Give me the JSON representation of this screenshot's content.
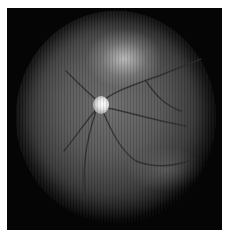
{
  "image": {
    "subject": "retinal fundus photograph",
    "style": "grayscale",
    "features": [
      "optic-disc",
      "retinal-vessels",
      "bright-superior-region"
    ],
    "colors": {
      "border": "#ffffff",
      "frame": "#050505",
      "fundus_center": "#6d6d6d",
      "fundus_edge": "#080808",
      "optic_disc": "#ffffff"
    }
  }
}
